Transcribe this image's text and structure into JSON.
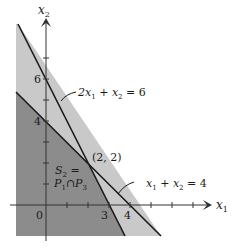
{
  "diagram": {
    "x_axis_label": "x",
    "x_axis_sub": "1",
    "y_axis_label": "x",
    "y_axis_sub": "2",
    "origin_label": "0",
    "x_tick_labels": [
      "3",
      "4"
    ],
    "y_tick_labels": [
      "6",
      "4"
    ],
    "line1": {
      "equation_parts": [
        "2x",
        "1",
        " + x",
        "2",
        " = 6"
      ],
      "equation": "2x1 + x2 = 6"
    },
    "line2": {
      "equation_parts": [
        "x",
        "1",
        " + x",
        "2",
        " = 4"
      ],
      "equation": "x1 + x2 = 4"
    },
    "intersection_label": "(2, 2)",
    "region_label_line1": "S",
    "region_label_line1_sub": "2",
    "region_label_line1_rest": " =",
    "region_label_line2": "P",
    "region_label_line2_sub1": "1",
    "region_label_line2_mid": "∩P",
    "region_label_line2_sub2": "3",
    "colors": {
      "light_region": "#c9c9c9",
      "dark_region": "#8c8c8c",
      "lines": "#1a1a1a"
    }
  }
}
